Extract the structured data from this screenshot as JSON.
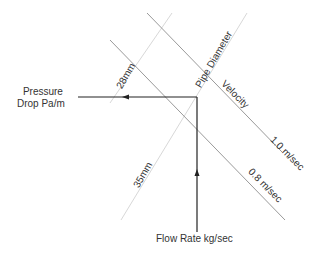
{
  "diagram": {
    "type": "pipe-sizing-nomogram",
    "axes": {
      "pressure_drop": "Pressure\nDrop Pa/m",
      "pressure_drop_line1": "Pressure",
      "pressure_drop_line2": "Drop Pa/m",
      "flow_rate": "Flow Rate kg/sec",
      "pipe_diameter": "Pipe Diameter",
      "velocity": "Velocity"
    },
    "pipe_diameter_lines": [
      {
        "label": "28mm"
      },
      {
        "label": "35mm"
      }
    ],
    "velocity_lines": [
      {
        "label": "1.0 m/sec"
      },
      {
        "label": "0.8 m/sec"
      }
    ],
    "colors": {
      "arrow": "#222222",
      "velocity_line": "#9a9a9a",
      "diameter_line": "#d8d8d8",
      "text": "#333333"
    }
  }
}
